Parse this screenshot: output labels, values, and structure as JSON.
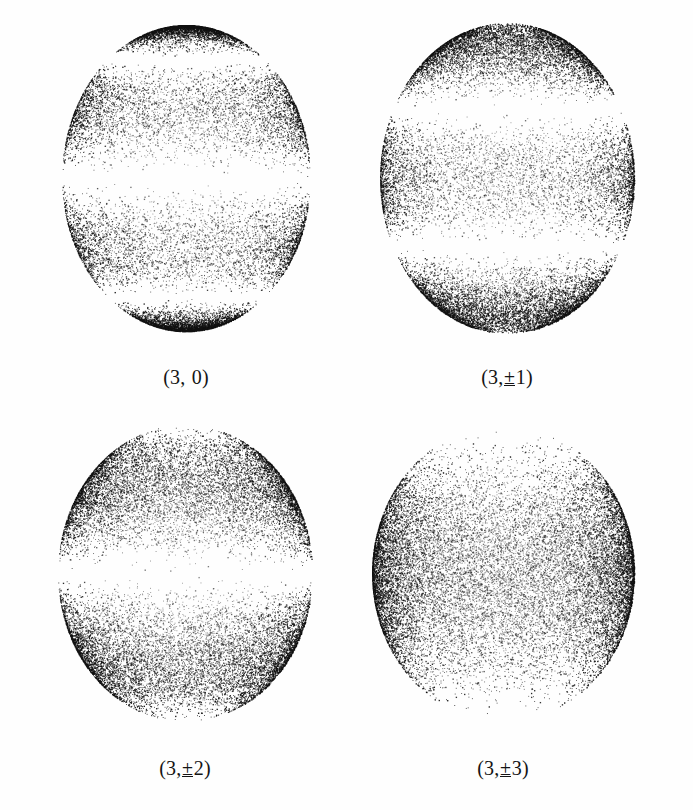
{
  "figure": {
    "background_color": "#ffffff",
    "ink_color": "#1a1a1a",
    "columns": 2,
    "rows": 2
  },
  "panels": [
    {
      "id": "panel-3-0",
      "caption": "(3, 0)",
      "caption_prefix": "(3, ",
      "caption_pm": "",
      "caption_suffix": "0)",
      "l": 3,
      "m": 0,
      "cx": 186,
      "cy": 178,
      "rx": 124,
      "ry": 153,
      "points": 17000,
      "caption_x": 186,
      "caption_y": 367
    },
    {
      "id": "panel-3-pm1",
      "caption": "(3,±1)",
      "caption_prefix": "(3,",
      "caption_pm": "±",
      "caption_suffix": "1)",
      "l": 3,
      "m": 1,
      "cx": 507,
      "cy": 178,
      "rx": 127,
      "ry": 155,
      "points": 19000,
      "caption_x": 507,
      "caption_y": 367
    },
    {
      "id": "panel-3-pm2",
      "caption": "(3,±2)",
      "caption_prefix": "(3,",
      "caption_pm": "±",
      "caption_suffix": "2)",
      "l": 3,
      "m": 2,
      "cx": 185,
      "cy": 573,
      "rx": 127,
      "ry": 148,
      "points": 20000,
      "caption_x": 185,
      "caption_y": 758
    },
    {
      "id": "panel-3-pm3",
      "caption": "(3,±3)",
      "caption_prefix": "(3,",
      "caption_pm": "±",
      "caption_suffix": "3)",
      "l": 3,
      "m": 3,
      "cx": 503,
      "cy": 573,
      "rx": 131,
      "ry": 148,
      "points": 21000,
      "caption_x": 503,
      "caption_y": 758
    }
  ],
  "chart_data": {
    "type": "scatter",
    "title": "",
    "xlabel": "",
    "ylabel": "",
    "series": [
      {
        "name": "(3, 0)",
        "l": 3,
        "m": 0,
        "n_points": 17000,
        "nodal_latitudes_deg": [
          39.2,
          -39.2,
          0
        ],
        "nodal_bands_fraction_of_diameter": [
          0.135,
          0.5,
          0.865
        ],
        "density_lobes_fraction_of_diameter": [
          0.045,
          0.3,
          0.7,
          0.955
        ]
      },
      {
        "name": "(3,±1)",
        "l": 3,
        "m": 1,
        "n_points": 19000,
        "nodal_latitudes_deg": [
          63.4,
          -63.4
        ],
        "nodal_bands_fraction_of_diameter": [
          0.29,
          0.71
        ],
        "density_lobes_fraction_of_diameter": [
          0.11,
          0.5,
          0.89
        ]
      },
      {
        "name": "(3,±2)",
        "l": 3,
        "m": 2,
        "n_points": 20000,
        "nodal_latitudes_deg": [
          0
        ],
        "nodal_bands_fraction_of_diameter": [
          0.5
        ],
        "density_lobes_fraction_of_diameter": [
          0.27,
          0.73
        ]
      },
      {
        "name": "(3,±3)",
        "l": 3,
        "m": 3,
        "n_points": 21000,
        "nodal_latitudes_deg": [],
        "nodal_bands_fraction_of_diameter": [],
        "density_lobes_fraction_of_diameter": [
          0.5
        ]
      }
    ],
    "legend_position": "none",
    "grid": false
  }
}
